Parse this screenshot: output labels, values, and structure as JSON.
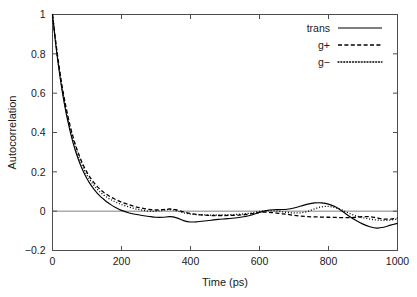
{
  "chart_data": {
    "type": "line",
    "title": "",
    "xlabel": "Time (ps)",
    "ylabel": "Autocorrelation",
    "xlim": [
      0,
      1000
    ],
    "ylim": [
      -0.2,
      1.0
    ],
    "xticks": [
      0,
      200,
      400,
      600,
      800,
      1000
    ],
    "xtick_labels": [
      "0",
      "200",
      "400",
      "600",
      "800",
      "1000"
    ],
    "yticks": [
      -0.2,
      0,
      0.2,
      0.4,
      0.6,
      0.8,
      1
    ],
    "ytick_labels": [
      "-0.2",
      "0",
      "0.2",
      "0.4",
      "0.6",
      "0.8",
      "1"
    ],
    "grid": false,
    "zero_reference_line": true,
    "legend_position": "top-right",
    "x": [
      0,
      10,
      20,
      30,
      40,
      50,
      60,
      70,
      80,
      90,
      100,
      110,
      120,
      130,
      140,
      150,
      160,
      170,
      180,
      190,
      200,
      220,
      240,
      260,
      280,
      300,
      320,
      340,
      360,
      380,
      400,
      420,
      440,
      460,
      480,
      500,
      520,
      540,
      560,
      580,
      600,
      620,
      640,
      660,
      680,
      700,
      720,
      740,
      760,
      780,
      800,
      820,
      840,
      860,
      880,
      900,
      920,
      940,
      960,
      980,
      1000
    ],
    "series": [
      {
        "name": "trans",
        "style": "solid",
        "color": "#000000",
        "values": [
          1.0,
          0.84,
          0.705,
          0.59,
          0.495,
          0.415,
          0.345,
          0.288,
          0.24,
          0.199,
          0.165,
          0.136,
          0.112,
          0.091,
          0.073,
          0.058,
          0.044,
          0.032,
          0.021,
          0.012,
          0.004,
          -0.008,
          -0.016,
          -0.022,
          -0.027,
          -0.031,
          -0.031,
          -0.028,
          -0.034,
          -0.048,
          -0.055,
          -0.054,
          -0.05,
          -0.046,
          -0.042,
          -0.039,
          -0.036,
          -0.032,
          -0.027,
          -0.018,
          -0.006,
          0.003,
          0.007,
          0.008,
          0.01,
          0.016,
          0.026,
          0.036,
          0.042,
          0.042,
          0.036,
          0.022,
          0.0,
          -0.026,
          -0.048,
          -0.066,
          -0.079,
          -0.086,
          -0.082,
          -0.071,
          -0.062
        ]
      },
      {
        "name": "g+",
        "style": "dashed",
        "color": "#000000",
        "values": [
          1.0,
          0.852,
          0.724,
          0.614,
          0.521,
          0.442,
          0.375,
          0.319,
          0.271,
          0.231,
          0.197,
          0.169,
          0.145,
          0.125,
          0.108,
          0.094,
          0.082,
          0.071,
          0.062,
          0.054,
          0.046,
          0.034,
          0.023,
          0.015,
          0.009,
          0.006,
          0.008,
          0.011,
          0.006,
          -0.004,
          -0.012,
          -0.017,
          -0.02,
          -0.022,
          -0.022,
          -0.022,
          -0.021,
          -0.02,
          -0.017,
          -0.012,
          -0.006,
          -0.005,
          -0.008,
          -0.012,
          -0.016,
          -0.021,
          -0.025,
          -0.028,
          -0.029,
          -0.03,
          -0.031,
          -0.032,
          -0.033,
          -0.033,
          -0.031,
          -0.028,
          -0.028,
          -0.034,
          -0.04,
          -0.04,
          -0.035
        ]
      },
      {
        "name": "g-",
        "style": "dotted",
        "color": "#000000",
        "values": [
          1.0,
          0.846,
          0.714,
          0.601,
          0.506,
          0.427,
          0.36,
          0.304,
          0.257,
          0.217,
          0.183,
          0.155,
          0.131,
          0.111,
          0.094,
          0.08,
          0.068,
          0.058,
          0.049,
          0.041,
          0.034,
          0.022,
          0.012,
          0.005,
          0.0,
          0.0,
          0.004,
          0.008,
          0.002,
          -0.008,
          -0.015,
          -0.018,
          -0.019,
          -0.02,
          -0.02,
          -0.019,
          -0.018,
          -0.016,
          -0.013,
          -0.008,
          -0.001,
          0.003,
          0.002,
          -0.002,
          -0.006,
          -0.009,
          -0.008,
          -0.001,
          0.012,
          0.022,
          0.024,
          0.018,
          0.005,
          -0.011,
          -0.024,
          -0.034,
          -0.04,
          -0.045,
          -0.047,
          -0.045,
          -0.04
        ]
      }
    ],
    "legend": [
      {
        "label": "trans",
        "style": "solid"
      },
      {
        "label": "g+",
        "style": "dashed"
      },
      {
        "label": "g-",
        "style": "dotted"
      }
    ]
  }
}
